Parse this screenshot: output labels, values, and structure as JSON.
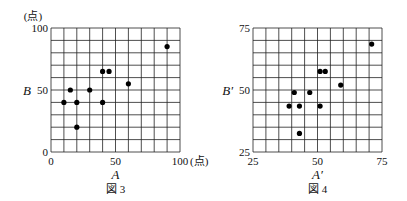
{
  "chart_data": [
    {
      "type": "scatter",
      "caption": "図 3",
      "xlabel": "A",
      "ylabel": "B",
      "unit_label": "(点)",
      "x_unit_label": "(点)",
      "xlim": [
        0,
        100
      ],
      "ylim": [
        0,
        100
      ],
      "xticks": [
        0,
        50,
        100
      ],
      "yticks": [
        0,
        50,
        100
      ],
      "grid": true,
      "grid_step": 10,
      "points": [
        {
          "x": 10,
          "y": 40
        },
        {
          "x": 15,
          "y": 50
        },
        {
          "x": 20,
          "y": 40
        },
        {
          "x": 20,
          "y": 20
        },
        {
          "x": 30,
          "y": 50
        },
        {
          "x": 40,
          "y": 40
        },
        {
          "x": 40,
          "y": 65
        },
        {
          "x": 45,
          "y": 65
        },
        {
          "x": 60,
          "y": 55
        },
        {
          "x": 90,
          "y": 85
        }
      ]
    },
    {
      "type": "scatter",
      "caption": "図 4",
      "xlabel": "A′",
      "ylabel": "B′",
      "xlim": [
        25,
        75
      ],
      "ylim": [
        25,
        75
      ],
      "xticks": [
        25,
        50,
        75
      ],
      "yticks": [
        25,
        50,
        75
      ],
      "grid": true,
      "grid_step": 5,
      "points": [
        {
          "x": 39,
          "y": 43.5
        },
        {
          "x": 41,
          "y": 49
        },
        {
          "x": 43,
          "y": 43.5
        },
        {
          "x": 43,
          "y": 32.5
        },
        {
          "x": 47,
          "y": 49
        },
        {
          "x": 51,
          "y": 43.5
        },
        {
          "x": 51,
          "y": 57.5
        },
        {
          "x": 53,
          "y": 57.5
        },
        {
          "x": 59,
          "y": 52
        },
        {
          "x": 71,
          "y": 68.5
        }
      ]
    }
  ]
}
